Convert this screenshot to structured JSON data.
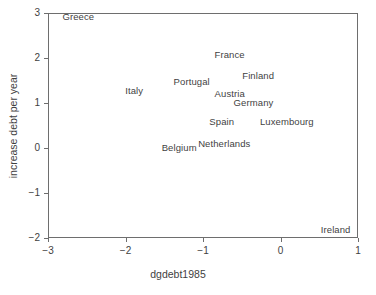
{
  "chart_data": {
    "type": "scatter",
    "title": "",
    "xlabel": "dgdebt1985",
    "ylabel": "increase debt per year",
    "xlim": [
      -3,
      1
    ],
    "ylim": [
      -2,
      3
    ],
    "xticks": [
      "-3",
      "-2",
      "-1",
      "0",
      "1"
    ],
    "yticks": [
      "3",
      "2",
      "1",
      "0",
      "-1",
      "-2"
    ],
    "grid": false,
    "legend": null,
    "marker_style": "text-labels-only",
    "points": [
      {
        "label": "Greece",
        "x": -2.62,
        "y": 2.93
      },
      {
        "label": "France",
        "x": -0.67,
        "y": 2.1
      },
      {
        "label": "Finland",
        "x": -0.3,
        "y": 1.62
      },
      {
        "label": "Portugal",
        "x": -1.16,
        "y": 1.5
      },
      {
        "label": "Italy",
        "x": -1.9,
        "y": 1.28
      },
      {
        "label": "Austria",
        "x": -0.67,
        "y": 1.23
      },
      {
        "label": "Germany",
        "x": -0.36,
        "y": 1.03
      },
      {
        "label": "Spain",
        "x": -0.77,
        "y": 0.6
      },
      {
        "label": "Luxembourg",
        "x": 0.07,
        "y": 0.6
      },
      {
        "label": "Netherlands",
        "x": -0.74,
        "y": 0.12
      },
      {
        "label": "Belgium",
        "x": -1.32,
        "y": 0.02
      },
      {
        "label": "Ireland",
        "x": 0.7,
        "y": -1.8
      }
    ]
  },
  "axes": {
    "x_title": "dgdebt1985",
    "y_title": "increase debt per year",
    "x_tick_labels": [
      "-3",
      "-2",
      "-1",
      "0",
      "1"
    ],
    "y_tick_labels": [
      "3",
      "2",
      "1",
      "0",
      "-1",
      "-2"
    ]
  },
  "colors": {
    "frame": "#6e6e6e",
    "text": "#3f3f3f",
    "background": "#ffffff"
  }
}
